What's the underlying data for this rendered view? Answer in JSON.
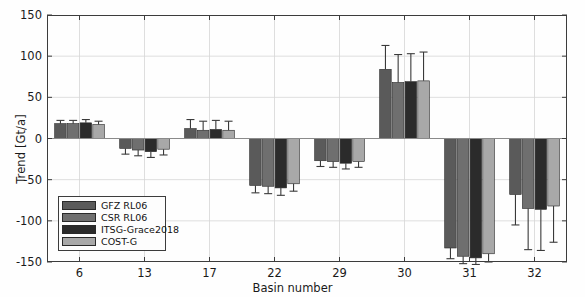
{
  "chart_data": {
    "type": "bar",
    "title": "",
    "xlabel": "Basin number",
    "ylabel": "Trend [Gt/a]",
    "ylim": [
      -150,
      150
    ],
    "yticks": [
      150,
      100,
      50,
      0,
      -50,
      -100,
      -150
    ],
    "ytick_labels": [
      "150",
      "100",
      "50",
      "0",
      "-50",
      "-100",
      "-150"
    ],
    "grid": true,
    "legend_position": "lower-left",
    "categories": [
      "6",
      "13",
      "17",
      "22",
      "29",
      "30",
      "31",
      "32"
    ],
    "series": [
      {
        "name": "GFZ RL06",
        "color": "#5a5a5a",
        "values": [
          18,
          -12,
          12,
          -57,
          -27,
          84,
          -133,
          -68
        ],
        "errors": [
          4,
          7,
          11,
          9,
          7,
          29,
          13,
          37
        ]
      },
      {
        "name": "CSR RL06",
        "color": "#6f6f6f",
        "values": [
          18,
          -14,
          10,
          -58,
          -28,
          68,
          -143,
          -85
        ],
        "errors": [
          4,
          7,
          11,
          9,
          7,
          34,
          9,
          50
        ]
      },
      {
        "name": "ITSG-Grace2018",
        "color": "#2b2b2b",
        "values": [
          19,
          -16,
          11,
          -60,
          -30,
          69,
          -145,
          -86
        ],
        "errors": [
          4,
          7,
          11,
          9,
          7,
          34,
          8,
          50
        ]
      },
      {
        "name": "COST-G",
        "color": "#a8a8a8",
        "values": [
          17,
          -13,
          10,
          -55,
          -28,
          70,
          -140,
          -82
        ],
        "errors": [
          4,
          7,
          11,
          9,
          7,
          35,
          10,
          44
        ]
      }
    ]
  },
  "legend": {
    "items": [
      {
        "label": "GFZ RL06"
      },
      {
        "label": "CSR RL06"
      },
      {
        "label": "ITSG-Grace2018"
      },
      {
        "label": "COST-G"
      }
    ]
  },
  "axes": {
    "x_title": "Basin number",
    "y_title": "Trend [Gt/a]"
  }
}
